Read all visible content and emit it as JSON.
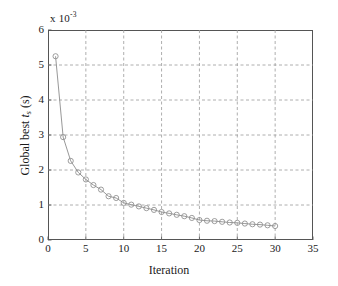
{
  "chart_data": {
    "type": "line",
    "title": "",
    "xlabel": "Iteration",
    "ylabel": "Global best t_s (s)",
    "ylabel_main": "Global best ",
    "ylabel_var": "t",
    "ylabel_sub": "s",
    "ylabel_unit": " (s)",
    "exponent_prefix": "x 10",
    "exponent_power": "-3",
    "y_axis_multiplier": 0.001,
    "xlim": [
      0,
      35
    ],
    "ylim": [
      0,
      6
    ],
    "xticks": [
      0,
      5,
      10,
      15,
      20,
      25,
      30,
      35
    ],
    "yticks": [
      0,
      1,
      2,
      3,
      4,
      5,
      6
    ],
    "xtick_labels": [
      "0",
      "5",
      "10",
      "15",
      "20",
      "25",
      "30",
      "35"
    ],
    "ytick_labels": [
      "0",
      "1",
      "2",
      "3",
      "4",
      "5",
      "6"
    ],
    "grid": true,
    "grid_style": "dashed",
    "grid_color": "#999999",
    "legend": false,
    "marker": "circle-open",
    "marker_color": "#8c8c8c",
    "line_color": "#8c8c8c",
    "series": [
      {
        "name": "Global best",
        "x": [
          1,
          2,
          3,
          4,
          5,
          6,
          7,
          8,
          9,
          10,
          11,
          12,
          13,
          14,
          15,
          16,
          17,
          18,
          19,
          20,
          21,
          22,
          23,
          24,
          25,
          26,
          27,
          28,
          29,
          30
        ],
        "values": [
          5.25,
          2.94,
          2.26,
          1.93,
          1.73,
          1.57,
          1.44,
          1.25,
          1.2,
          1.06,
          1.01,
          0.96,
          0.91,
          0.86,
          0.8,
          0.76,
          0.72,
          0.68,
          0.63,
          0.57,
          0.55,
          0.54,
          0.52,
          0.5,
          0.49,
          0.47,
          0.45,
          0.44,
          0.42,
          0.4
        ]
      }
    ]
  }
}
